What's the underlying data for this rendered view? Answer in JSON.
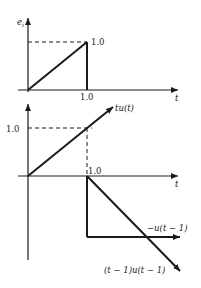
{
  "diagram": {
    "top_plot": {
      "y_axis_label": "e",
      "y_axis_subscript": "i",
      "x_axis_label": "t",
      "level_label": "1.0",
      "time_label": "1.0"
    },
    "bottom_plot": {
      "level_label": "1.0",
      "time_label": "1.0",
      "x_axis_label": "t",
      "ramp_label": "tu(t)",
      "step_label": "−u(t − 1)",
      "delayed_ramp_label": "(t − 1)u(t − 1)"
    },
    "colors": {
      "line": "#1a1a1a",
      "text": "#222222"
    }
  }
}
